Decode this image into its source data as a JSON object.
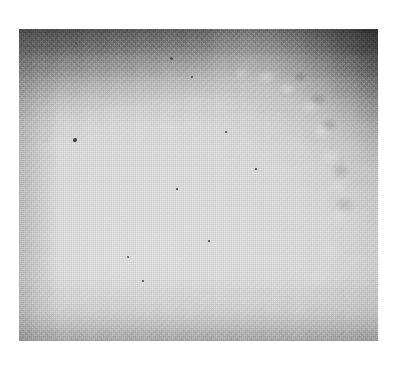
{
  "page": {
    "background_color": "#ffffff",
    "width": 396,
    "height": 368
  },
  "figure": {
    "name": "mammogram-radiograph",
    "modality": "mammography",
    "colorspace": "grayscale",
    "frame": {
      "x": 19,
      "y": 29,
      "width": 359,
      "height": 312
    },
    "palette": {
      "air_black": "#080808",
      "air_dark_gray": "#3f3f3f",
      "skin_edge_gray": "#7e7e7e",
      "pectoral_gray": "#6f6f6f",
      "tissue_mid_gray": "#c0c0c0",
      "tissue_light": "#e8e8e8",
      "tissue_brightest": "#f0f0f0",
      "speck_gray": "#4b4b4b",
      "page_white": "#ffffff"
    },
    "regions": [
      {
        "id": "breast-tissue",
        "label": "breast tissue",
        "tone": "bright"
      },
      {
        "id": "air-background",
        "label": "air background",
        "tone": "black"
      },
      {
        "id": "pectoral-band",
        "label": "chest wall band",
        "tone": "mid-gray"
      },
      {
        "id": "skin-line",
        "label": "skin line / nodular edge",
        "tone": "gradient"
      }
    ],
    "specks": [
      {
        "x": 57,
        "y": 14,
        "size": 2.4
      },
      {
        "x": 152,
        "y": 29,
        "size": 3.0
      },
      {
        "x": 173,
        "y": 48,
        "size": 1.8
      },
      {
        "x": 56,
        "y": 111,
        "size": 3.2
      },
      {
        "x": 109,
        "y": 228,
        "size": 2.2
      },
      {
        "x": 207,
        "y": 103,
        "size": 1.8
      },
      {
        "x": 158,
        "y": 160,
        "size": 1.6
      },
      {
        "x": 124,
        "y": 252,
        "size": 1.8
      },
      {
        "x": 237,
        "y": 140,
        "size": 1.5
      },
      {
        "x": 190,
        "y": 212,
        "size": 1.5
      }
    ]
  }
}
